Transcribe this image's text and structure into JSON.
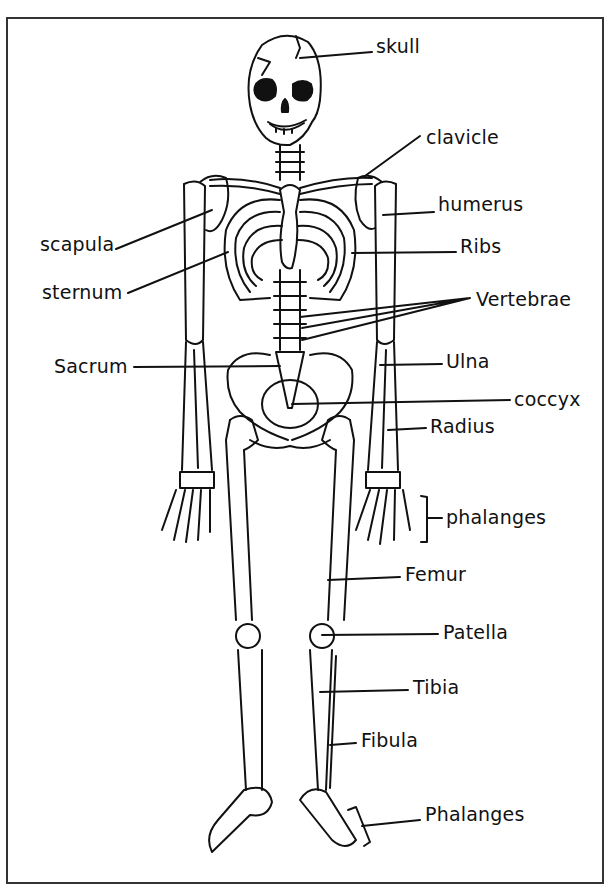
{
  "diagram": {
    "labels": [
      {
        "id": "skull",
        "text": "skull",
        "x": 376,
        "y": 37
      },
      {
        "id": "clavicle",
        "text": "clavicle",
        "x": 426,
        "y": 128
      },
      {
        "id": "humerus",
        "text": "humerus",
        "x": 438,
        "y": 195
      },
      {
        "id": "scapula",
        "text": "scapula",
        "x": 40,
        "y": 235
      },
      {
        "id": "ribs",
        "text": "Ribs",
        "x": 460,
        "y": 237
      },
      {
        "id": "sternum",
        "text": "sternum",
        "x": 42,
        "y": 283
      },
      {
        "id": "vertebrae",
        "text": "Vertebrae",
        "x": 476,
        "y": 290
      },
      {
        "id": "sacrum",
        "text": "Sacrum",
        "x": 54,
        "y": 357
      },
      {
        "id": "ulna",
        "text": "Ulna",
        "x": 446,
        "y": 352
      },
      {
        "id": "coccyx",
        "text": "coccyx",
        "x": 514,
        "y": 390
      },
      {
        "id": "radius",
        "text": "Radius",
        "x": 430,
        "y": 417
      },
      {
        "id": "phalanges-hand",
        "text": "phalanges",
        "x": 446,
        "y": 508
      },
      {
        "id": "femur",
        "text": "Femur",
        "x": 405,
        "y": 565
      },
      {
        "id": "patella",
        "text": "Patella",
        "x": 443,
        "y": 623
      },
      {
        "id": "tibia",
        "text": "Tibia",
        "x": 413,
        "y": 678
      },
      {
        "id": "fibula",
        "text": "Fibula",
        "x": 361,
        "y": 731
      },
      {
        "id": "phalanges-foot",
        "text": "Phalanges",
        "x": 425,
        "y": 805
      }
    ]
  }
}
